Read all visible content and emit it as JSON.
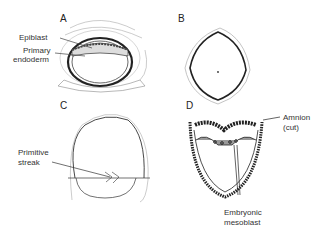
{
  "panels": {
    "A": {
      "letter": "A",
      "labels": {
        "epiblast": "Epiblast",
        "primary_endoderm_1": "Primary",
        "primary_endoderm_2": "endoderm"
      }
    },
    "B": {
      "letter": "B"
    },
    "C": {
      "letter": "C",
      "labels": {
        "primitive_streak_1": "Primitive",
        "primitive_streak_2": "streak"
      }
    },
    "D": {
      "letter": "D",
      "labels": {
        "amnion_1": "Amnion",
        "amnion_2": "(cut)",
        "mesoblast_1": "Embryonic",
        "mesoblast_2": "mesoblast"
      }
    }
  }
}
